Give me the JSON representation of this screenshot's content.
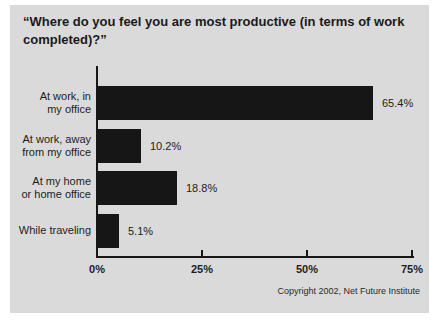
{
  "chart_data": {
    "type": "bar",
    "orientation": "horizontal",
    "title": "“Where do you feel you are most productive (in terms of work completed)?”",
    "categories": [
      "At work, in\nmy office",
      "At work, away\nfrom my office",
      "At my home\nor home office",
      "While traveling"
    ],
    "values": [
      65.4,
      10.2,
      18.8,
      5.1
    ],
    "value_labels": [
      "65.4%",
      "10.2%",
      "18.8%",
      "5.1%"
    ],
    "x_ticks": [
      "0%",
      "25%",
      "50%",
      "75%"
    ],
    "x_tick_values": [
      0,
      25,
      50,
      75
    ],
    "xlim": [
      0,
      75
    ],
    "grid": false,
    "legend": false,
    "bar_color": "#161616",
    "background_color": "#dadada",
    "text_color": "#1d1d1d"
  },
  "footer": {
    "copyright": "Copyright 2002, Net Future Institute"
  }
}
